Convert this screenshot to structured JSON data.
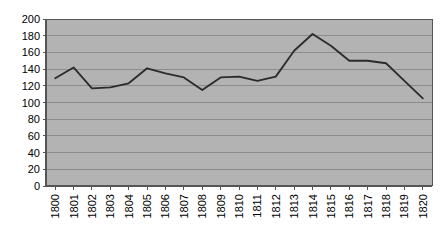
{
  "chart_data": {
    "type": "line",
    "title": "",
    "subtitle": "",
    "xlabel": "",
    "ylabel": "",
    "categories": [
      "1800",
      "1801",
      "1802",
      "1803",
      "1804",
      "1805",
      "1806",
      "1807",
      "1808",
      "1809",
      "1810",
      "1811",
      "1812",
      "1813",
      "1814",
      "1815",
      "1816",
      "1817",
      "1818",
      "1819",
      "1820"
    ],
    "values": [
      129,
      142,
      117,
      118,
      123,
      141,
      135,
      130,
      115,
      130,
      131,
      126,
      131,
      162,
      182,
      168,
      150,
      150,
      147,
      126,
      105
    ],
    "series": [
      {
        "name": "series-1",
        "values": [
          129,
          142,
          117,
          118,
          123,
          141,
          135,
          130,
          115,
          130,
          131,
          126,
          131,
          162,
          182,
          168,
          150,
          150,
          147,
          126,
          105
        ]
      }
    ],
    "ylim": [
      0,
      200
    ],
    "yticks": [
      0,
      20,
      40,
      60,
      80,
      100,
      120,
      140,
      160,
      180,
      200
    ],
    "ytick_labels": [
      "0",
      "20",
      "40",
      "60",
      "80",
      "100",
      "120",
      "140",
      "160",
      "180",
      "200"
    ],
    "xtick_labels": [
      "1800",
      "1801",
      "1802",
      "1803",
      "1804",
      "1805",
      "1806",
      "1807",
      "1808",
      "1809",
      "1810",
      "1811",
      "1812",
      "1813",
      "1814",
      "1815",
      "1816",
      "1817",
      "1818",
      "1819",
      "1820"
    ],
    "grid": true,
    "grid_axis": "y",
    "legend": false,
    "legend_position": "none",
    "xtick_rotation": 90,
    "annotations": []
  },
  "style": {
    "plot_background": "#b3b3b3",
    "page_background": "#ffffff",
    "line_color": "#2b2b2b",
    "grid_color": "#8c8c8c",
    "axis_color": "#555555",
    "tick_color": "#555555",
    "label_color": "#000000"
  },
  "geometry": {
    "plot_left": 46,
    "plot_right": 432,
    "plot_top": 19,
    "plot_bottom": 186
  }
}
